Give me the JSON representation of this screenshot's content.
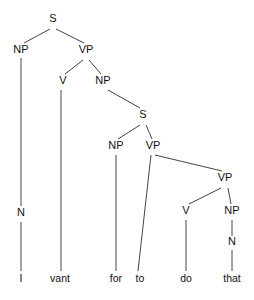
{
  "diagram": {
    "type": "syntax-tree",
    "colors": {
      "line": "#444444",
      "text": "#111111",
      "background": "#ffffff"
    },
    "nodes": [
      {
        "id": "s1",
        "label": "S",
        "x": 53,
        "y": 22
      },
      {
        "id": "np1",
        "label": "NP",
        "x": 21,
        "y": 53
      },
      {
        "id": "vp1",
        "label": "VP",
        "x": 86,
        "y": 53
      },
      {
        "id": "v1",
        "label": "V",
        "x": 63,
        "y": 84
      },
      {
        "id": "np2",
        "label": "NP",
        "x": 103,
        "y": 84
      },
      {
        "id": "s2",
        "label": "S",
        "x": 143,
        "y": 118
      },
      {
        "id": "np3",
        "label": "NP",
        "x": 116,
        "y": 149
      },
      {
        "id": "vp2",
        "label": "VP",
        "x": 153,
        "y": 149
      },
      {
        "id": "vp3",
        "label": "VP",
        "x": 225,
        "y": 181
      },
      {
        "id": "v2",
        "label": "V",
        "x": 186,
        "y": 214
      },
      {
        "id": "np4",
        "label": "NP",
        "x": 232,
        "y": 214
      },
      {
        "id": "n1",
        "label": "N",
        "x": 21,
        "y": 216
      },
      {
        "id": "n2",
        "label": "N",
        "x": 232,
        "y": 245
      }
    ],
    "words": [
      {
        "id": "w1",
        "label": "I",
        "x": 21,
        "y": 282
      },
      {
        "id": "w2",
        "label": "vant",
        "x": 60,
        "y": 282
      },
      {
        "id": "w3",
        "label": "for",
        "x": 116,
        "y": 282
      },
      {
        "id": "w4",
        "label": "to",
        "x": 140,
        "y": 282
      },
      {
        "id": "w5",
        "label": "do",
        "x": 186,
        "y": 282
      },
      {
        "id": "w6",
        "label": "that",
        "x": 232,
        "y": 282
      }
    ],
    "edges": [
      {
        "from": "s1",
        "to": "np1",
        "x1": 50,
        "y1": 29,
        "x2": 24,
        "y2": 43
      },
      {
        "from": "s1",
        "to": "vp1",
        "x1": 56,
        "y1": 29,
        "x2": 84,
        "y2": 43
      },
      {
        "from": "np1",
        "to": "n1",
        "x1": 21,
        "y1": 58,
        "x2": 21,
        "y2": 206
      },
      {
        "from": "vp1",
        "to": "v1",
        "x1": 83,
        "y1": 60,
        "x2": 65,
        "y2": 74
      },
      {
        "from": "vp1",
        "to": "np2",
        "x1": 89,
        "y1": 60,
        "x2": 101,
        "y2": 74
      },
      {
        "from": "v1",
        "to": "w2",
        "x1": 61,
        "y1": 90,
        "x2": 61,
        "y2": 271
      },
      {
        "from": "np2",
        "to": "s2",
        "x1": 108,
        "y1": 90,
        "x2": 140,
        "y2": 108
      },
      {
        "from": "s2",
        "to": "np3",
        "x1": 140,
        "y1": 125,
        "x2": 118,
        "y2": 139
      },
      {
        "from": "s2",
        "to": "vp2",
        "x1": 146,
        "y1": 125,
        "x2": 152,
        "y2": 139
      },
      {
        "from": "np3",
        "to": "w3",
        "x1": 116,
        "y1": 155,
        "x2": 116,
        "y2": 271
      },
      {
        "from": "vp2",
        "to": "w4",
        "x1": 151,
        "y1": 155,
        "x2": 138,
        "y2": 271
      },
      {
        "from": "vp2",
        "to": "vp3",
        "x1": 155,
        "y1": 155,
        "x2": 222,
        "y2": 171
      },
      {
        "from": "vp3",
        "to": "v2",
        "x1": 221,
        "y1": 188,
        "x2": 189,
        "y2": 204
      },
      {
        "from": "vp3",
        "to": "np4",
        "x1": 228,
        "y1": 188,
        "x2": 231,
        "y2": 204
      },
      {
        "from": "v2",
        "to": "w5",
        "x1": 186,
        "y1": 220,
        "x2": 186,
        "y2": 271
      },
      {
        "from": "np4",
        "to": "n2",
        "x1": 232,
        "y1": 220,
        "x2": 232,
        "y2": 236
      },
      {
        "from": "n2",
        "to": "w6",
        "x1": 232,
        "y1": 250,
        "x2": 232,
        "y2": 271
      },
      {
        "from": "n1",
        "to": "w1",
        "x1": 21,
        "y1": 222,
        "x2": 21,
        "y2": 271
      }
    ]
  }
}
